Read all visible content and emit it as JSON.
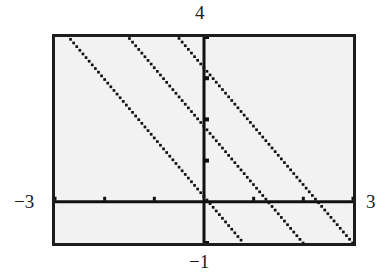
{
  "figure": {
    "kind": "graphing-calculator-plot",
    "background_color": "#f2f2f2",
    "frame_color": "#1c1c1c",
    "ink_color": "#111111"
  },
  "labels": {
    "top": "4",
    "bottom": "−1",
    "left": "−3",
    "right": "3"
  },
  "chart_data": {
    "type": "line",
    "title": "",
    "xlabel": "",
    "ylabel": "",
    "xlim": [
      -3,
      3
    ],
    "ylim": [
      -1,
      4
    ],
    "grid": false,
    "legend": null,
    "axes": {
      "x_axis_y_value": 0,
      "y_axis_x_value": 0,
      "x_tick_step": 1,
      "y_tick_step": 1,
      "x_ticks": [
        -3,
        -2,
        -1,
        0,
        1,
        2,
        3
      ],
      "y_ticks": [
        -1,
        0,
        1,
        2,
        3,
        4
      ],
      "tick_style": "short-marks-on-axes"
    },
    "series": [
      {
        "name": "line-1",
        "style": "dotted",
        "slope": -1.42,
        "x_intercept": 0.09,
        "points": [
          [
            -2.4,
            3.6
          ],
          [
            -0.6,
            1.0
          ],
          [
            0.09,
            0.0
          ],
          [
            0.8,
            -1.0
          ]
        ]
      },
      {
        "name": "line-2",
        "style": "dotted",
        "slope": -1.42,
        "x_intercept": 1.29,
        "points": [
          [
            -0.8,
            3.7
          ],
          [
            0.3,
            1.4
          ],
          [
            1.29,
            0.0
          ],
          [
            2.0,
            -1.0
          ]
        ]
      },
      {
        "name": "line-3",
        "style": "dotted",
        "slope": -1.42,
        "x_intercept": 2.29,
        "points": [
          [
            0.0,
            3.0
          ],
          [
            1.0,
            1.6
          ],
          [
            2.29,
            0.0
          ],
          [
            3.0,
            -1.0
          ]
        ]
      }
    ]
  }
}
